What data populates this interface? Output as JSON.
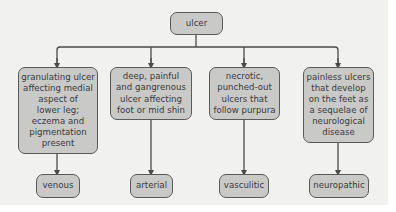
{
  "diagram": {
    "root": {
      "label": "ulcer"
    },
    "branches": [
      {
        "description": "granulating ulcer\naffecting medial\naspect of\nlower leg;\neczema and\npigmentation\npresent",
        "type": "venous"
      },
      {
        "description": "deep, painful\nand gangrenous\nulcer affecting\nfoot or mid shin",
        "type": "arterial"
      },
      {
        "description": "necrotic,\npunched-out\nulcers that\nfollow purpura",
        "type": "vasculitic"
      },
      {
        "description": "painless ulcers\nthat develop\non the feet as\na sequelae of\nneurological\ndisease",
        "type": "neuropathic"
      }
    ],
    "colors": {
      "background": "#f1f1f0",
      "node_fill": "#c9c9c8",
      "node_border": "#5a5a5a",
      "line": "#4a4a4a",
      "text": "#3a3a3a"
    }
  }
}
